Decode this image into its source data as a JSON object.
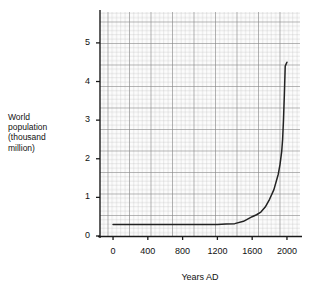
{
  "chart_data": {
    "type": "line",
    "title": "",
    "xlabel": "Years AD",
    "ylabel": "World\npopulation\n(thousand\nmillion)",
    "ylabel_lines": [
      "World",
      "population",
      "(thousand",
      "million)"
    ],
    "xlim": [
      -150,
      2150
    ],
    "ylim": [
      0,
      5.8
    ],
    "xticks": [
      0,
      400,
      800,
      1200,
      1600,
      2000
    ],
    "xticklabels": [
      "0",
      "400",
      "800",
      "1200",
      "1600",
      "2000"
    ],
    "yticks": [
      0,
      1,
      2,
      3,
      4,
      5
    ],
    "yticklabels": [
      "0",
      "1",
      "2",
      "3",
      "4",
      "5"
    ],
    "grid": "graph-paper, minor and major gridlines",
    "legend": "none",
    "series": [
      {
        "name": "World population",
        "x": [
          0,
          200,
          400,
          600,
          800,
          1000,
          1100,
          1200,
          1300,
          1400,
          1500,
          1600,
          1650,
          1700,
          1750,
          1800,
          1850,
          1900,
          1920,
          1940,
          1950,
          1960,
          1970,
          1980,
          1990,
          2000
        ],
        "values": [
          0.3,
          0.3,
          0.3,
          0.3,
          0.3,
          0.3,
          0.3,
          0.3,
          0.31,
          0.32,
          0.38,
          0.5,
          0.55,
          0.62,
          0.75,
          0.95,
          1.2,
          1.6,
          1.85,
          2.2,
          2.5,
          3.0,
          3.65,
          4.4,
          4.45,
          4.5
        ]
      }
    ],
    "annotations": [],
    "colors": {
      "curve": "#222222",
      "axis": "#1a1a1a",
      "grid_minor": "#b9b9b9",
      "grid_major": "#7a7a7a",
      "background": "#ffffff",
      "plot_background": "#fbfbfb"
    }
  },
  "geometry": {
    "plot_left": 100,
    "plot_right": 300,
    "plot_top": 12,
    "plot_bottom": 236
  }
}
